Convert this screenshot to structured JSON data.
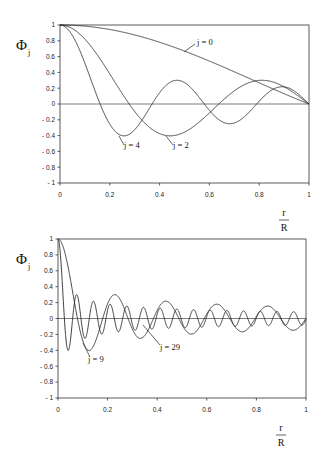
{
  "chart_data": [
    {
      "type": "line",
      "title": "",
      "xlabel_num": "r",
      "xlabel_den": "R",
      "ylabel": "Φ",
      "ylabel_sub": "j",
      "xlim": [
        0,
        1
      ],
      "ylim": [
        -1,
        1
      ],
      "x_ticks": [
        "0",
        "0.2",
        "0.4",
        "0.6",
        "0.8",
        "1"
      ],
      "y_ticks": [
        "1",
        "0.8",
        "0.6",
        "0.4",
        "0.2",
        "0",
        "-0.2",
        "-0.4",
        "-0.6",
        "-0.8",
        "-1"
      ],
      "grid": false,
      "zero_line": true,
      "frame": {
        "left": 60,
        "right": 309,
        "top": 25,
        "bottom": 183
      },
      "series": [
        {
          "name": "j = 0",
          "function": "J0(lambda*x)",
          "lambda": 2.4048,
          "label_x": 197,
          "label_y": 45,
          "leader": [
            [
              184,
              52
            ],
            [
              195,
              44
            ]
          ]
        },
        {
          "name": "j = 2",
          "function": "J0(lambda*x)",
          "lambda": 8.6537,
          "label_x": 173,
          "label_y": 148,
          "leader": [
            [
              166,
              136
            ],
            [
              173,
              145
            ]
          ]
        },
        {
          "name": "j = 4",
          "function": "J0(lambda*x)",
          "lambda": 14.9309,
          "label_x": 124,
          "label_y": 148,
          "leader": [
            [
              119,
              136
            ],
            [
              124,
              145
            ]
          ]
        }
      ],
      "sample_values": {
        "j = 0": [
          [
            0,
            1.0
          ],
          [
            0.2,
            0.94
          ],
          [
            0.4,
            0.78
          ],
          [
            0.6,
            0.54
          ],
          [
            0.8,
            0.3
          ],
          [
            1.0,
            0.0
          ]
        ],
        "j = 2": [
          [
            0,
            1.0
          ],
          [
            0.28,
            0.0
          ],
          [
            0.44,
            -0.4
          ],
          [
            0.64,
            0.0
          ],
          [
            0.8,
            0.3
          ],
          [
            1.0,
            0.0
          ]
        ],
        "j = 4": [
          [
            0,
            1.0
          ],
          [
            0.16,
            0.0
          ],
          [
            0.26,
            -0.4
          ],
          [
            0.45,
            0.3
          ],
          [
            0.66,
            -0.25
          ],
          [
            0.88,
            0.22
          ],
          [
            1.0,
            0.0
          ]
        ]
      }
    },
    {
      "type": "line",
      "title": "",
      "xlabel_num": "r",
      "xlabel_den": "R",
      "ylabel": "Φ",
      "ylabel_sub": "j",
      "xlim": [
        0,
        1
      ],
      "ylim": [
        -1,
        1
      ],
      "x_ticks": [
        "0",
        "0.2",
        "0.4",
        "0.6",
        "0.8",
        "1"
      ],
      "y_ticks": [
        "1",
        "0.8",
        "0.6",
        "0.4",
        "0.2",
        "0",
        "-0.2",
        "-0.4",
        "-0.6",
        "-0.8",
        "-1"
      ],
      "grid": false,
      "zero_line": true,
      "frame": {
        "left": 58,
        "right": 306,
        "top": 239,
        "bottom": 398
      },
      "series": [
        {
          "name": "j = 9",
          "function": "J0(lambda*x)",
          "lambda": 30.6346,
          "label_x": 88,
          "label_y": 362,
          "leader": [
            [
              83,
              343
            ],
            [
              90,
              357
            ]
          ]
        },
        {
          "name": "j = 29",
          "function": "J0(lambda*x)",
          "lambda": 93.4,
          "label_x": 160,
          "label_y": 350,
          "leader": [
            [
              143,
              325
            ],
            [
              160,
              345
            ]
          ]
        }
      ],
      "sample_values": {
        "j = 9": [
          [
            0,
            1.0
          ],
          [
            0.1,
            -0.4
          ],
          [
            0.2,
            0.28
          ],
          [
            0.3,
            -0.24
          ],
          [
            0.4,
            0.2
          ],
          [
            0.6,
            0.17
          ],
          [
            0.8,
            0.15
          ],
          [
            0.92,
            -0.2
          ],
          [
            1.0,
            -0.05
          ]
        ],
        "j = 29": [
          [
            0,
            1.0
          ],
          [
            0.035,
            -0.38
          ],
          [
            0.065,
            0.28
          ],
          [
            0.13,
            0.2
          ],
          [
            0.5,
            0.1
          ],
          [
            1.0,
            -0.05
          ]
        ]
      }
    }
  ]
}
